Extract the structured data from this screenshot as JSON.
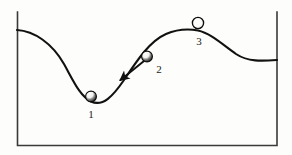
{
  "figure": {
    "kind": "energy-landscape-diagram",
    "background_color": "#fdfdfb",
    "ink_color": "#111111",
    "frame": {
      "name": "open-top-rectangle-border",
      "left_x": 17,
      "right_x": 277,
      "bottom_y": 146,
      "top_y": 12,
      "stroke_color": "#3a3a38",
      "stroke_width": 1.6,
      "has_top_edge": false
    },
    "curve": {
      "name": "terrain-curve",
      "stroke_color": "#111111",
      "stroke_width": 2.1,
      "start_point": [
        17,
        30
      ],
      "end_point": [
        277,
        60
      ],
      "valley_point": [
        91,
        102
      ],
      "peak_point": [
        198,
        30
      ],
      "secondary_trough_point": [
        252,
        62
      ],
      "path": "M 17 30 C 34 31 52 43 64 64 C 74 82 80 96 91 101.5 C 103 107 113 96 124 80 C 138 59 150 41 166 34 C 180 28 190 29 198 30.5 C 210 33 222 44 236 54 C 248 62 262 61 277 60"
    },
    "balls": [
      {
        "name": "ball-position-1",
        "label": "1",
        "cx": 91,
        "cy": 96.5,
        "r": 5.4,
        "fill_light": "#ffffff",
        "fill_shadow": "#151515",
        "outline": "#0d0d0d"
      },
      {
        "name": "ball-position-2",
        "label": "2",
        "cx": 147,
        "cy": 56.5,
        "r": 5.4,
        "fill_light": "#ffffff",
        "fill_shadow": "#151515",
        "outline": "#0d0d0d"
      },
      {
        "name": "ball-position-3",
        "label": "3",
        "cx": 198,
        "cy": 23,
        "r": 5.6,
        "fill_light": "#ffffff",
        "fill_shadow": "#303030",
        "outline": "#0d0d0d"
      }
    ],
    "arrow": {
      "name": "motion-direction-arrow",
      "tail": [
        144,
        61
      ],
      "head": [
        119,
        81
      ],
      "stroke_color": "#111111",
      "stroke_width": 2.0,
      "points": "down-left"
    },
    "labels": {
      "one": "1",
      "two": "2",
      "three": "3"
    }
  }
}
